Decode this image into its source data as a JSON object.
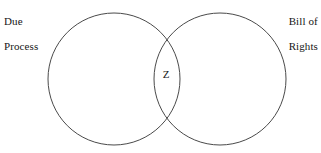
{
  "diagram": {
    "type": "venn-two-set",
    "background_color": "#ffffff",
    "stroke_color": "#4a4a4a",
    "text_color": "#161616",
    "left_set": {
      "label_line1": "Due",
      "label_line2": "Process",
      "center_x": 114,
      "center_y": 79,
      "radius": 66
    },
    "right_set": {
      "label_line1": "Bill of",
      "label_line2": "Rights",
      "center_x": 220,
      "center_y": 79,
      "radius": 66
    },
    "intersection": {
      "label": "Z"
    }
  }
}
